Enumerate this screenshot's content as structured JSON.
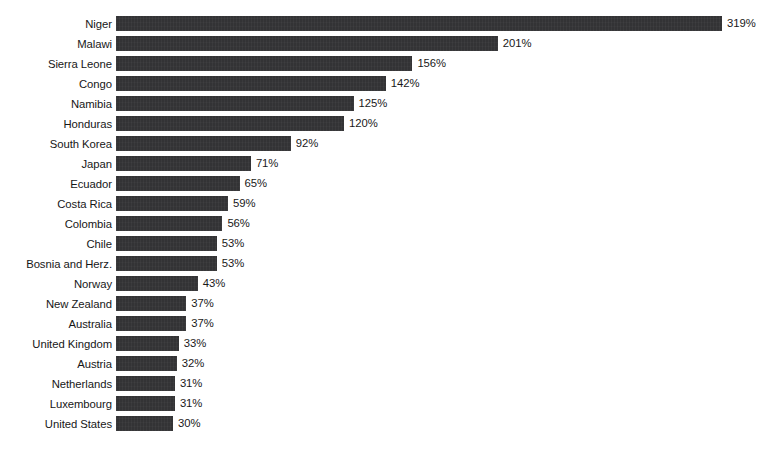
{
  "chart_data": {
    "type": "bar",
    "orientation": "horizontal",
    "title": "",
    "subtitle": "",
    "xlabel": "",
    "ylabel": "",
    "value_suffix": "%",
    "grid": false,
    "legend": false,
    "axis_visible": false,
    "xlim": [
      0,
      319
    ],
    "bar_color": "#333335",
    "background_color": "#ffffff",
    "categories": [
      "Niger",
      "Malawi",
      "Sierra Leone",
      "Congo",
      "Namibia",
      "Honduras",
      "South Korea",
      "Japan",
      "Ecuador",
      "Costa Rica",
      "Colombia",
      "Chile",
      "Bosnia and Herz.",
      "Norway",
      "New Zealand",
      "Australia",
      "United Kingdom",
      "Austria",
      "Netherlands",
      "Luxembourg",
      "United States"
    ],
    "values": [
      319,
      201,
      156,
      142,
      125,
      120,
      92,
      71,
      65,
      59,
      56,
      53,
      53,
      43,
      37,
      37,
      33,
      32,
      31,
      31,
      30
    ],
    "value_labels": [
      "319%",
      "201%",
      "156%",
      "142%",
      "125%",
      "120%",
      "92%",
      "71%",
      "65%",
      "59%",
      "56%",
      "53%",
      "53%",
      "43%",
      "37%",
      "37%",
      "33%",
      "32%",
      "31%",
      "31%",
      "30%"
    ]
  },
  "layout": {
    "title_remnant": "",
    "source_remnant": ""
  }
}
